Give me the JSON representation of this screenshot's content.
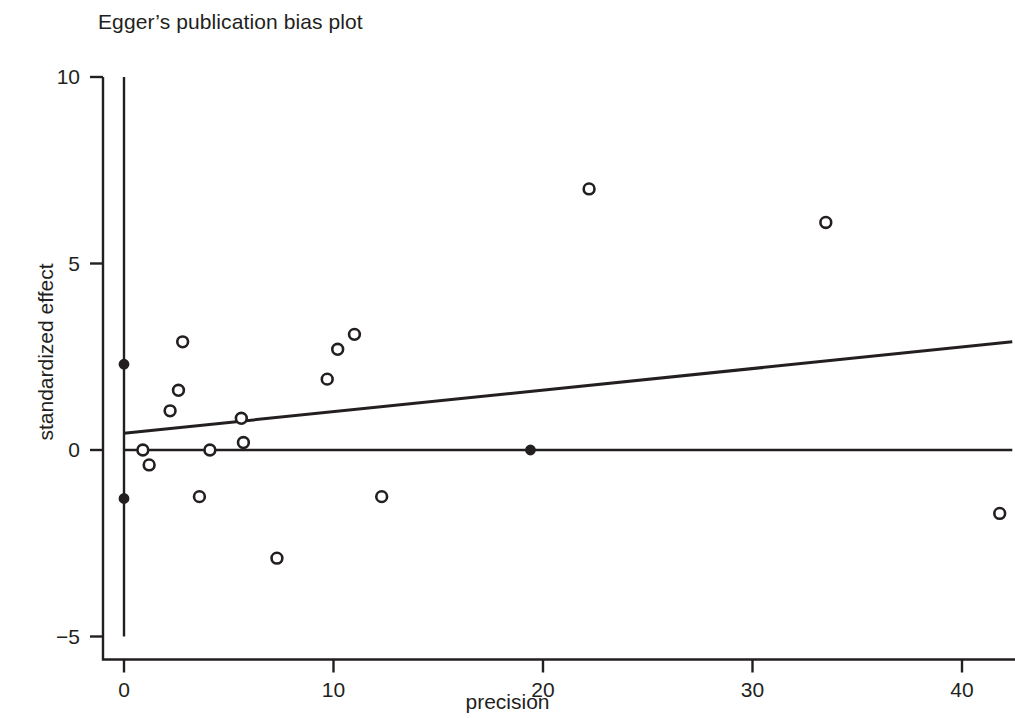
{
  "chart_data": {
    "type": "scatter",
    "title": "Egger’s publication bias plot",
    "xlabel": "precision",
    "ylabel": "standardized effect",
    "xlim": [
      -0.7,
      42.6
    ],
    "ylim": [
      -5.6,
      10.4
    ],
    "xticks": [
      0,
      10,
      20,
      30,
      40
    ],
    "xtick_labels": [
      "0",
      "10",
      "20",
      "30",
      "40"
    ],
    "yticks": [
      10,
      5,
      0,
      -5
    ],
    "ytick_labels": [
      "10",
      "5",
      "0",
      "−5"
    ],
    "grid": false,
    "legend": "none",
    "points_open": [
      {
        "x": 0.9,
        "y": 0.0
      },
      {
        "x": 1.2,
        "y": -0.4
      },
      {
        "x": 2.2,
        "y": 1.05
      },
      {
        "x": 2.6,
        "y": 1.6
      },
      {
        "x": 2.8,
        "y": 2.9
      },
      {
        "x": 3.6,
        "y": -1.25
      },
      {
        "x": 4.1,
        "y": 0.0
      },
      {
        "x": 5.6,
        "y": 0.85
      },
      {
        "x": 5.7,
        "y": 0.2
      },
      {
        "x": 7.3,
        "y": -2.9
      },
      {
        "x": 9.7,
        "y": 1.9
      },
      {
        "x": 10.2,
        "y": 2.7
      },
      {
        "x": 11.0,
        "y": 3.1
      },
      {
        "x": 12.3,
        "y": -1.25
      },
      {
        "x": 22.2,
        "y": 7.0
      },
      {
        "x": 33.5,
        "y": 6.1
      },
      {
        "x": 41.8,
        "y": -1.7
      }
    ],
    "points_filled": [
      {
        "x": 0.0,
        "y": 2.3
      },
      {
        "x": 0.0,
        "y": -1.3
      },
      {
        "x": 19.4,
        "y": 0.0
      }
    ],
    "reference_line": {
      "y": 0.0,
      "x_start": 0.0,
      "x_end": 42.4
    },
    "vertical_line": {
      "x": 0.0,
      "y_start": -5.0,
      "y_end": 10.0
    },
    "regression_line": {
      "intercept": 0.45,
      "slope": 0.0578,
      "x_start": 0.0,
      "x_end": 42.4,
      "y_start": 0.45,
      "y_end": 2.9
    },
    "colors": {
      "ink": "#231f20",
      "background": "#ffffff"
    }
  }
}
